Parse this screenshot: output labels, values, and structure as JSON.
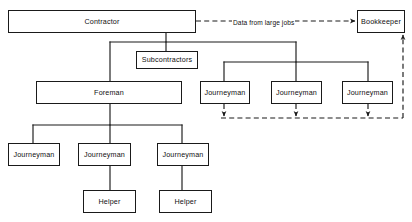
{
  "diagram": {
    "canvas": {
      "width": 412,
      "height": 222,
      "background": "#ffffff"
    },
    "stroke_color": "#1a1a1a",
    "nodes": [
      {
        "id": "contractor",
        "label": "Contractor",
        "x": 8,
        "y": 10,
        "w": 188,
        "h": 23
      },
      {
        "id": "bookkeeper",
        "label": "Bookkeeper",
        "x": 357,
        "y": 10,
        "w": 48,
        "h": 23
      },
      {
        "id": "subcontractors",
        "label": "Subcontractors",
        "x": 136,
        "y": 51,
        "w": 62,
        "h": 18
      },
      {
        "id": "foreman",
        "label": "Foreman",
        "x": 36,
        "y": 81,
        "w": 146,
        "h": 23
      },
      {
        "id": "journeyman-r1",
        "label": "Journeyman",
        "x": 200,
        "y": 81,
        "w": 50,
        "h": 23
      },
      {
        "id": "journeyman-r2",
        "label": "Journeyman",
        "x": 271,
        "y": 81,
        "w": 51,
        "h": 23
      },
      {
        "id": "journeyman-r3",
        "label": "Journeyman",
        "x": 342,
        "y": 81,
        "w": 51,
        "h": 23
      },
      {
        "id": "journeyman-b1",
        "label": "Journeyman",
        "x": 8,
        "y": 143,
        "w": 52,
        "h": 23
      },
      {
        "id": "journeyman-b2",
        "label": "Journeyman",
        "x": 78,
        "y": 143,
        "w": 53,
        "h": 23
      },
      {
        "id": "journeyman-b3",
        "label": "Journeyman",
        "x": 157,
        "y": 143,
        "w": 52,
        "h": 23
      },
      {
        "id": "helper-1",
        "label": "Helper",
        "x": 83,
        "y": 190,
        "w": 53,
        "h": 23
      },
      {
        "id": "helper-2",
        "label": "Helper",
        "x": 159,
        "y": 190,
        "w": 53,
        "h": 23
      }
    ],
    "edge_labels": [
      {
        "id": "data-from-large-jobs",
        "text": "Data from large jobs",
        "x": 232,
        "y": 19
      }
    ],
    "solid_edges": [
      {
        "id": "contractor-to-trunk",
        "points": "166,33 166,42"
      },
      {
        "id": "trunk-horizontal",
        "points": "110,42 296,42"
      },
      {
        "id": "trunk-to-subcontractors",
        "points": "166,42 166,51"
      },
      {
        "id": "trunk-to-foreman",
        "points": "110,42 110,81"
      },
      {
        "id": "right-drop",
        "points": "296,42 296,62"
      },
      {
        "id": "right-spread",
        "points": "224,62 368,62"
      },
      {
        "id": "right-to-j1",
        "points": "224,62 224,81"
      },
      {
        "id": "right-to-j2",
        "points": "296,62 296,81"
      },
      {
        "id": "right-to-j3",
        "points": "368,62 368,81"
      },
      {
        "id": "foreman-drop",
        "points": "110,104 110,125"
      },
      {
        "id": "foreman-spread",
        "points": "33,125 182,125"
      },
      {
        "id": "foreman-to-jb1",
        "points": "33,125 33,143"
      },
      {
        "id": "foreman-to-jb2",
        "points": "110,125 110,143"
      },
      {
        "id": "foreman-to-jb3",
        "points": "182,125 182,143"
      },
      {
        "id": "jb2-to-helper1",
        "points": "110,166 110,190"
      },
      {
        "id": "jb3-to-helper2",
        "points": "182,166 182,190"
      }
    ],
    "dashed_edges": [
      {
        "id": "contractor-to-bookkeeper",
        "points": "196,21 355,21",
        "arrow": "end"
      },
      {
        "id": "j1-to-return",
        "points": "224,104 224,116",
        "arrow": "end"
      },
      {
        "id": "j2-to-return",
        "points": "296,104 296,116",
        "arrow": "end"
      },
      {
        "id": "j3-to-return",
        "points": "368,104 368,116",
        "arrow": "end"
      },
      {
        "id": "return-bus",
        "points": "221,118 403,118",
        "arrow": "none"
      },
      {
        "id": "return-to-bookkeeper",
        "points": "403,118 403,35",
        "arrow": "end"
      }
    ]
  }
}
